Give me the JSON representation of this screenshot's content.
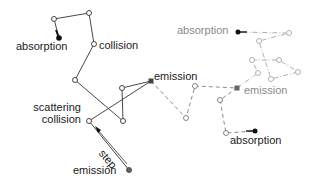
{
  "labels": {
    "absorption_black": "absorption",
    "collision": "collision",
    "emission_mid": "emission",
    "scattering": "scattering",
    "collision2": "collision",
    "step": "step",
    "emission_bottom": "emission",
    "absorption_gray_top": "absorption",
    "emission_gray": "emission",
    "absorption_gray_bottom": "absorption"
  },
  "colors": {
    "path1": "#333333",
    "path2": "#8c8c8c",
    "path3": "#a8a8a8",
    "text_dark": "#222222",
    "text_gray": "#8a8a8a"
  }
}
